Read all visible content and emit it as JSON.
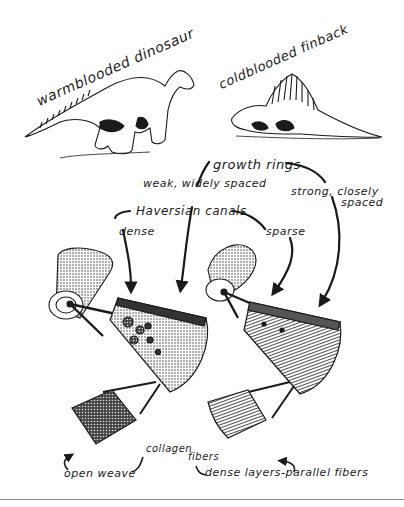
{
  "diagram": {
    "animals": {
      "left": {
        "label": "warmblooded dinosaur",
        "icon": "hadrosaur-illustration"
      },
      "right": {
        "label": "coldblooded finback",
        "icon": "dimetrodon-illustration"
      }
    },
    "features": {
      "growth_rings": {
        "label": "growth rings",
        "left_value": "weak, widely spaced",
        "right_value_line1": "strong, closely",
        "right_value_line2": "spaced"
      },
      "haversian_canals": {
        "label": "Haversian canals",
        "left_value": "dense",
        "right_value": "sparse"
      },
      "collagen_fibers": {
        "label_part1": "collagen",
        "label_part2": "fibers",
        "left_value": "open weave",
        "right_value": "dense layers-parallel fibers"
      }
    },
    "illustrations": [
      {
        "name": "left-bone",
        "icon": "femur-bone-icon"
      },
      {
        "name": "left-cross-section",
        "icon": "bone-section-wedge-icon"
      },
      {
        "name": "left-fiber-block",
        "icon": "fiber-block-icon"
      },
      {
        "name": "right-bone",
        "icon": "femur-bone-icon"
      },
      {
        "name": "right-cross-section",
        "icon": "bone-section-wedge-icon"
      },
      {
        "name": "right-fiber-block",
        "icon": "fiber-block-icon"
      }
    ],
    "colors": {
      "ink": "#1a1a1a",
      "paper": "#ffffff",
      "rule": "#8a8a8a"
    }
  }
}
